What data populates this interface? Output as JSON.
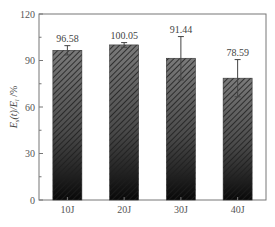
{
  "chart_data": {
    "type": "bar",
    "title": "",
    "xlabel": "",
    "ylabel": "E_s(t)/E_i /%",
    "ylim": [
      0,
      120
    ],
    "yticks": [
      0,
      30,
      60,
      90,
      120
    ],
    "categories": [
      "10J",
      "20J",
      "30J",
      "40J"
    ],
    "values": [
      96.58,
      100.05,
      91.44,
      78.59
    ],
    "errors": [
      3.0,
      1.5,
      14.0,
      12.0
    ],
    "value_labels": [
      "96.58",
      "100.05",
      "91.44",
      "78.59"
    ],
    "grid": false,
    "legend": null,
    "bar_style": "diagonal hatch, gray-to-black vertical gradient"
  },
  "axis": {
    "ylabel_main": "E",
    "ylabel_sub1": "s",
    "ylabel_mid": "(t)/E",
    "ylabel_sub2": "i",
    "ylabel_unit": " /%"
  },
  "colors": {
    "bar_top": "#6e6e6e",
    "bar_bottom": "#0a0a0a",
    "hatch": "#2a2a2a",
    "axis": "#777777",
    "text": "#444444"
  }
}
